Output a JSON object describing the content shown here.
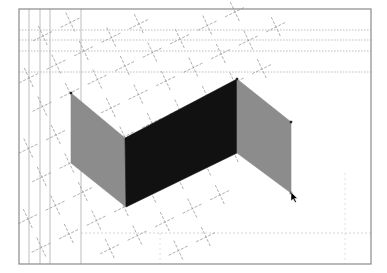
{
  "canvas": {
    "width": 387,
    "height": 273,
    "background": "#ffffff"
  },
  "frame": {
    "x": 19,
    "y": 9,
    "width": 352,
    "height": 255,
    "stroke": "#8a8a8a"
  },
  "guides": {
    "vertical_solid": [
      29,
      40,
      50,
      81
    ],
    "horizontal_dotted": [
      30,
      40,
      51,
      72
    ],
    "bottom_dotted_y": 233,
    "bottom_dotted_x_from": 81,
    "right_dotted_x": 345,
    "mid_dotted_x": 160,
    "color": "#b5b5b5"
  },
  "lattice": {
    "origin": [
      70,
      93
    ],
    "a": [
      27.5,
      -13.5
    ],
    "b": [
      13.5,
      28.5
    ],
    "i_range": [
      -4,
      12
    ],
    "j_range": [
      -4,
      8
    ],
    "band_min": -3,
    "band_max": 8,
    "arm": 11,
    "color": "#9a9a9a"
  },
  "shapes": [
    {
      "name": "left-panel",
      "fill": "#8c8c8c",
      "points": [
        [
          71,
          93
        ],
        [
          125,
          138
        ],
        [
          126,
          207
        ],
        [
          71,
          163
        ]
      ]
    },
    {
      "name": "center-panel",
      "fill": "#111111",
      "points": [
        [
          125,
          138
        ],
        [
          237,
          79
        ],
        [
          237,
          153
        ],
        [
          126,
          207
        ]
      ]
    },
    {
      "name": "right-panel",
      "fill": "#8c8c8c",
      "points": [
        [
          237,
          79
        ],
        [
          291,
          122
        ],
        [
          291,
          193
        ],
        [
          237,
          153
        ]
      ]
    }
  ],
  "vertices": [
    [
      71,
      93
    ],
    [
      237,
      79
    ],
    [
      291,
      122
    ],
    [
      291,
      193
    ]
  ],
  "cursor": {
    "x": 291,
    "y": 192,
    "color": "#000000"
  }
}
